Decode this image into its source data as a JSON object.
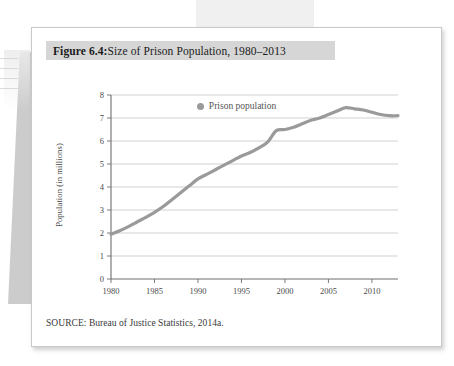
{
  "figure": {
    "caption_label": "Figure 6.4:",
    "caption_text": " Size of Prison Population, 1980–2013",
    "source_note": "SOURCE: Bureau of Justice Statistics, 2014a."
  },
  "legend": {
    "marker_name": "legend-dot",
    "label": "Prison population",
    "marker_color": "#9a9a9a"
  },
  "colors": {
    "line": "#9a9a9a",
    "gridline": "#c5c5c5",
    "axis": "#6e6e6e",
    "caption_band": "#d6d6d6",
    "card_border": "#c9c9c9",
    "tick_text": "#4a4a4a"
  },
  "chart_data": {
    "type": "line",
    "title": "Figure 6.4: Size of Prison Population, 1980–2013",
    "xlabel": "",
    "ylabel": "Population (in millions)",
    "xlim": [
      1980,
      2013
    ],
    "ylim": [
      0,
      8
    ],
    "grid": true,
    "legend_position": "top-center",
    "xticks": [
      1980,
      1985,
      1990,
      1995,
      2000,
      2005,
      2010
    ],
    "yticks": [
      0,
      1,
      2,
      3,
      4,
      5,
      6,
      7,
      8
    ],
    "series": [
      {
        "name": "Prison population",
        "color": "#9a9a9a",
        "x": [
          1980,
          1981,
          1982,
          1983,
          1984,
          1985,
          1986,
          1987,
          1988,
          1989,
          1990,
          1991,
          1992,
          1993,
          1994,
          1995,
          1996,
          1997,
          1998,
          1999,
          2000,
          2001,
          2002,
          2003,
          2004,
          2005,
          2006,
          2007,
          2008,
          2009,
          2010,
          2011,
          2012,
          2013
        ],
        "values": [
          1.95,
          2.1,
          2.28,
          2.48,
          2.68,
          2.9,
          3.15,
          3.45,
          3.75,
          4.05,
          4.35,
          4.55,
          4.75,
          4.95,
          5.15,
          5.35,
          5.5,
          5.7,
          5.95,
          6.45,
          6.5,
          6.6,
          6.75,
          6.9,
          7.0,
          7.15,
          7.3,
          7.45,
          7.4,
          7.35,
          7.25,
          7.15,
          7.1,
          7.1
        ]
      }
    ]
  }
}
